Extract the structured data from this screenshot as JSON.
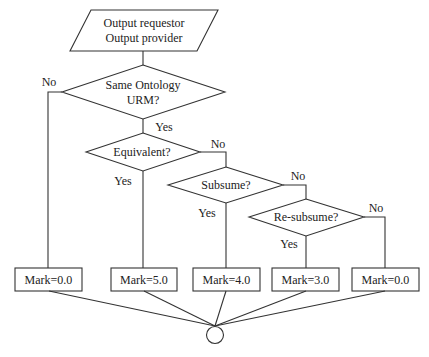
{
  "diagram": {
    "type": "flowchart",
    "start": {
      "line1": "Output requestor",
      "line2": "Output provider"
    },
    "decisions": [
      {
        "id": "d1",
        "line1": "Same Ontology",
        "line2": "URM?"
      },
      {
        "id": "d2",
        "label": "Equivalent?"
      },
      {
        "id": "d3",
        "label": "Subsume?"
      },
      {
        "id": "d4",
        "label": "Re-subsume?"
      }
    ],
    "edge_labels": {
      "d1_no": "No",
      "d1_yes": "Yes",
      "d2_no": "No",
      "d2_yes": "Yes",
      "d3_no": "No",
      "d3_yes": "Yes",
      "d4_no": "No",
      "d4_yes": "Yes"
    },
    "results": [
      {
        "label": "Mark=0.0"
      },
      {
        "label": "Mark=5.0"
      },
      {
        "label": "Mark=4.0"
      },
      {
        "label": "Mark=3.0"
      },
      {
        "label": "Mark=0.0"
      }
    ],
    "end": {
      "shape": "circle"
    },
    "colors": {
      "stroke": "#333333",
      "text": "#222222",
      "background": "#ffffff"
    }
  }
}
